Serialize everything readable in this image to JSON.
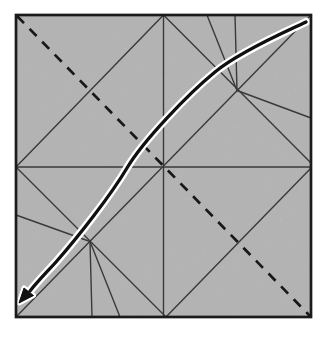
{
  "diagram": {
    "type": "origami-crease-pattern",
    "canvas": {
      "width": 330,
      "height": 338
    },
    "paper": {
      "x": 16,
      "y": 15,
      "width": 295,
      "height": 302,
      "fill": "#d7d7d7",
      "border_color": "#1b1b1b",
      "border_width": 2.7
    },
    "colors": {
      "background": "#ffffff",
      "crease": "#3a3a3a",
      "fold_line": "#181818",
      "arrow": "#101010",
      "arrow_halo": "#ffffff"
    },
    "crease_lines": [
      {
        "name": "vertical-midline",
        "x1": 163.5,
        "y1": 15,
        "x2": 163.5,
        "y2": 317
      },
      {
        "name": "horizontal-midline",
        "x1": 16,
        "y1": 167,
        "x2": 311,
        "y2": 167
      },
      {
        "name": "main-diagonal",
        "x1": 16,
        "y1": 317,
        "x2": 311,
        "y2": 15
      },
      {
        "name": "diamond-top-left",
        "x1": 16,
        "y1": 167,
        "x2": 163.5,
        "y2": 15
      },
      {
        "name": "diamond-top-right",
        "x1": 163.5,
        "y1": 15,
        "x2": 311,
        "y2": 163
      },
      {
        "name": "diamond-bottom-right",
        "x1": 311,
        "y1": 168,
        "x2": 166,
        "y2": 317
      },
      {
        "name": "diamond-bottom-left",
        "x1": 16,
        "y1": 167,
        "x2": 166,
        "y2": 317
      },
      {
        "name": "crease-tr-steep",
        "x1": 207,
        "y1": 15,
        "x2": 237,
        "y2": 90.5
      },
      {
        "name": "crease-tr-vertical",
        "x1": 235,
        "y1": 15,
        "x2": 237,
        "y2": 90.5
      },
      {
        "name": "crease-tr-to-right-edge",
        "x1": 237,
        "y1": 90.5,
        "x2": 311,
        "y2": 118
      },
      {
        "name": "crease-bl-steep",
        "x1": 120,
        "y1": 317,
        "x2": 90,
        "y2": 241.5
      },
      {
        "name": "crease-bl-vertical",
        "x1": 92,
        "y1": 317,
        "x2": 90,
        "y2": 241.5
      },
      {
        "name": "crease-bl-to-left-edge",
        "x1": 90,
        "y1": 241.5,
        "x2": 16,
        "y2": 215
      }
    ],
    "crease_width": 1.4,
    "valley_fold": {
      "x1": 17,
      "y1": 16,
      "x2": 310,
      "y2": 316,
      "dash": "10 8",
      "width": 2.7
    },
    "fold_arrow": {
      "path": "M 306 22 C 292 29 242 50 215 72 C 188 94 143 141 127 168 C 111 195 78 237 56 262 C 45 274 38 281 30 291",
      "width": 3.3,
      "halo_width": 8,
      "head_points": "19,303 33.5,295.5 24,288"
    }
  }
}
